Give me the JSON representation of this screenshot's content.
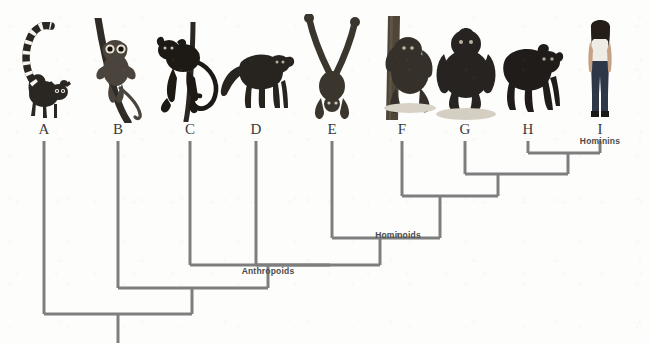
{
  "figure": {
    "background_color": "#fdfdfc",
    "branch_color": "#7e7e7e",
    "label_color": "#3a3a3a",
    "clade_label_color": "#4a4a4a"
  },
  "tips": [
    {
      "id": "A",
      "label": "A",
      "x": 44,
      "organism": "ring-tailed-lemur",
      "image_name": "lemur-image"
    },
    {
      "id": "B",
      "label": "B",
      "x": 118,
      "organism": "tarsier",
      "image_name": "tarsier-image"
    },
    {
      "id": "C",
      "label": "C",
      "x": 190,
      "organism": "spider-monkey",
      "image_name": "new-world-monkey-image"
    },
    {
      "id": "D",
      "label": "D",
      "x": 256,
      "organism": "baboon",
      "image_name": "old-world-monkey-image"
    },
    {
      "id": "E",
      "label": "E",
      "x": 332,
      "organism": "gibbon",
      "image_name": "gibbon-image"
    },
    {
      "id": "F",
      "label": "F",
      "x": 402,
      "organism": "orangutan",
      "image_name": "orangutan-image"
    },
    {
      "id": "G",
      "label": "G",
      "x": 465,
      "organism": "gorilla",
      "image_name": "gorilla-image"
    },
    {
      "id": "H",
      "label": "H",
      "x": 528,
      "organism": "chimpanzee",
      "image_name": "chimpanzee-image"
    },
    {
      "id": "I",
      "label": "I",
      "x": 600,
      "organism": "human",
      "image_name": "human-image"
    }
  ],
  "clade_labels": [
    {
      "name": "hominins",
      "text": "Hominins",
      "x": 600,
      "y": 137
    },
    {
      "name": "hominoids",
      "text": "Hominoids",
      "x": 398,
      "y": 231
    },
    {
      "name": "anthropoids",
      "text": "Anthropoids",
      "x": 268,
      "y": 267
    }
  ],
  "tip_label_y": 131,
  "nodes": [
    {
      "name": "node-hominins",
      "y": 153,
      "left_x": 528,
      "right_x": 600,
      "stem_x": 568,
      "stem_to_y": 174
    },
    {
      "name": "node-gorilla",
      "y": 174,
      "left_x": 465,
      "right_x": 568,
      "stem_x": 498,
      "stem_to_y": 196
    },
    {
      "name": "node-orangutan",
      "y": 196,
      "left_x": 402,
      "right_x": 498,
      "stem_x": 440,
      "stem_to_y": 238
    },
    {
      "name": "node-hominoids",
      "y": 238,
      "left_x": 332,
      "right_x": 440,
      "stem_x": 380,
      "stem_to_y": 265
    },
    {
      "name": "node-anthropoids",
      "y": 265,
      "left_x": 268,
      "right_x": 380,
      "stem_x": 330,
      "stem_to_y": 265
    },
    {
      "name": "node-catarrhine",
      "y": 265,
      "left_x": 192,
      "right_x": 330,
      "stem_x": 268,
      "stem_to_y": 288
    },
    {
      "name": "node-haplorhine",
      "y": 288,
      "left_x": 118,
      "right_x": 268,
      "stem_x": 192,
      "stem_to_y": 314
    },
    {
      "name": "node-root",
      "y": 314,
      "left_x": 44,
      "right_x": 192,
      "stem_x": 118,
      "stem_to_y": 343
    }
  ],
  "branches": [
    {
      "name": "branch-A",
      "x": 44,
      "from_y": 141,
      "to_y": 314
    },
    {
      "name": "branch-B",
      "x": 118,
      "from_y": 141,
      "to_y": 288
    },
    {
      "name": "branch-C",
      "x": 190,
      "from_y": 141,
      "to_y": 265
    },
    {
      "name": "branch-D",
      "x": 256,
      "from_y": 141,
      "to_y": 265
    },
    {
      "name": "branch-E",
      "x": 332,
      "from_y": 141,
      "to_y": 238
    },
    {
      "name": "branch-F",
      "x": 402,
      "from_y": 141,
      "to_y": 196
    },
    {
      "name": "branch-G",
      "x": 465,
      "from_y": 141,
      "to_y": 174
    },
    {
      "name": "branch-H",
      "x": 528,
      "from_y": 141,
      "to_y": 153
    },
    {
      "name": "branch-I",
      "x": 600,
      "from_y": 141,
      "to_y": 153
    }
  ],
  "tick_marks": [
    {
      "name": "tick-hominins",
      "x": 600,
      "y_top": 139,
      "y_bottom": 144
    },
    {
      "name": "tick-hominoids",
      "x": 398,
      "y_top": 233,
      "y_bottom": 238
    },
    {
      "name": "tick-anthropoids",
      "x": 268,
      "y_top": 269,
      "y_bottom": 274
    }
  ]
}
